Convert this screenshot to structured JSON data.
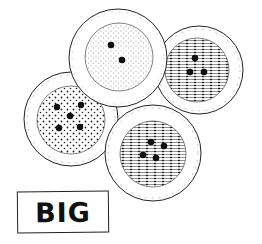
{
  "illustration": {
    "subject": "four round buttons",
    "label": "BIG",
    "colors": {
      "ink": "#111111",
      "paper": "#ffffff"
    },
    "buttons": [
      {
        "name": "left",
        "holes": 5,
        "texture": "dots"
      },
      {
        "name": "top",
        "holes": 2,
        "texture": "stipple"
      },
      {
        "name": "right",
        "holes": 3,
        "texture": "hatched"
      },
      {
        "name": "bottom",
        "holes": 4,
        "texture": "hatched"
      }
    ]
  }
}
